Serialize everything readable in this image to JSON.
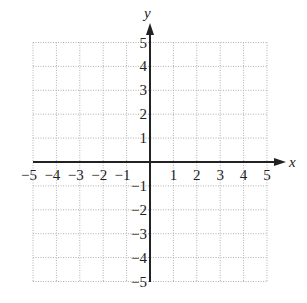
{
  "chart_data": {
    "type": "scatter",
    "title": "",
    "xlabel": "x",
    "ylabel": "y",
    "xlim": [
      -5,
      5
    ],
    "ylim": [
      -5,
      5
    ],
    "grid": true,
    "grid_style": "dotted",
    "x_ticks": [
      "-5",
      "-4",
      "-3",
      "-2",
      "-1",
      "1",
      "2",
      "3",
      "4",
      "5"
    ],
    "y_ticks": [
      "5",
      "4",
      "3",
      "2",
      "1",
      "-1",
      "-2",
      "-3",
      "-4",
      "-5"
    ],
    "series": [],
    "colors": {
      "axis": "#222222",
      "grid": "#b0b0b0",
      "text": "#222222"
    }
  },
  "labels": {
    "x_axis": "x",
    "y_axis": "y",
    "x_ticks": [
      {
        "text": "−5",
        "v": -5
      },
      {
        "text": "−4",
        "v": -4
      },
      {
        "text": "−3",
        "v": -3
      },
      {
        "text": "−2",
        "v": -2
      },
      {
        "text": "−1",
        "v": -1
      },
      {
        "text": "1",
        "v": 1
      },
      {
        "text": "2",
        "v": 2
      },
      {
        "text": "3",
        "v": 3
      },
      {
        "text": "4",
        "v": 4
      },
      {
        "text": "5",
        "v": 5
      }
    ],
    "y_ticks": [
      {
        "text": "5",
        "v": 5
      },
      {
        "text": "4",
        "v": 4
      },
      {
        "text": "3",
        "v": 3
      },
      {
        "text": "2",
        "v": 2
      },
      {
        "text": "1",
        "v": 1
      },
      {
        "text": "−1",
        "v": -1
      },
      {
        "text": "−2",
        "v": -2
      },
      {
        "text": "−3",
        "v": -3
      },
      {
        "text": "−4",
        "v": -4
      },
      {
        "text": "−5",
        "v": -5
      }
    ]
  }
}
